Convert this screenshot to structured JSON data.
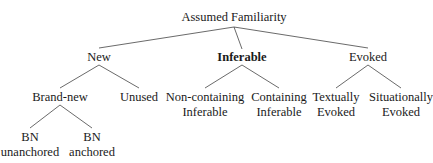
{
  "title": "Assumed Familiarity",
  "nodes": {
    "root": "Assumed Familiarity",
    "new": "New",
    "inferable": "Inferable",
    "evoked": "Evoked",
    "brand_new": "Brand-new",
    "unused": "Unused",
    "noncontaining_1": "Non-containing",
    "noncontaining_2": "Inferable",
    "containing_1": "Containing",
    "containing_2": "Inferable",
    "textually_1": "Textually",
    "textually_2": "Evoked",
    "situationally_1": "Situationally",
    "situationally_2": "Evoked",
    "bn_unanchored_1": "BN",
    "bn_unanchored_2": "unanchored",
    "bn_anchored_1": "BN",
    "bn_anchored_2": "anchored"
  },
  "colors": {
    "line": "#444444",
    "text": "#1a1a1a"
  }
}
